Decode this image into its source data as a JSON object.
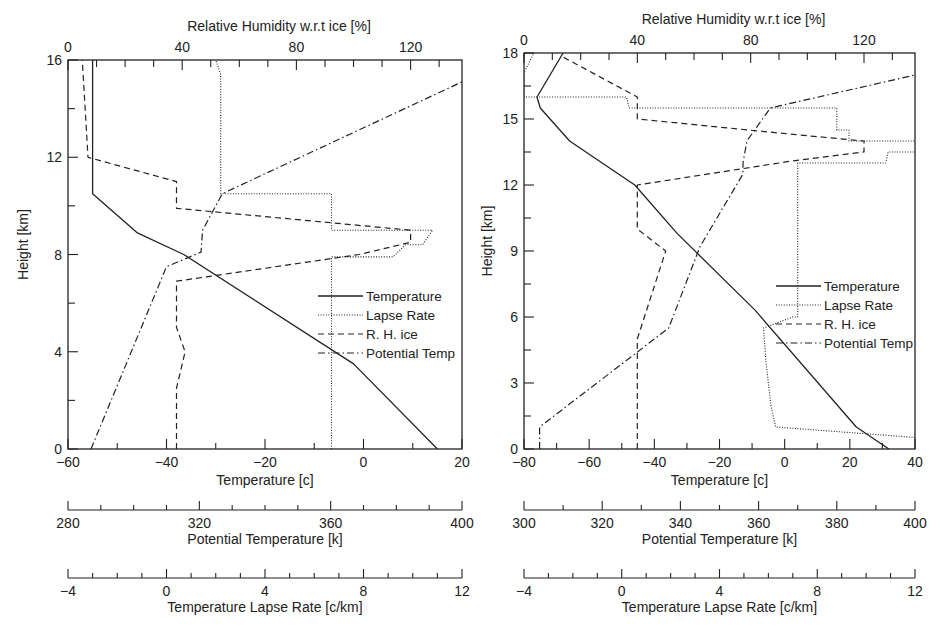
{
  "chart_data": [
    {
      "type": "line",
      "panel": "left",
      "xlabel": "Temperature [c]",
      "ylabel": "Height [km]",
      "top_axis_label": "Relative Humidity w.r.t ice [%]",
      "extra_axes": [
        {
          "label": "Potential Temperature [k]",
          "range": [
            280,
            400
          ],
          "ticks": [
            "280",
            "320",
            "360",
            "400"
          ],
          "minor_step": 10
        },
        {
          "label": "Temperature Lapse Rate [c/km]",
          "range": [
            -4,
            12
          ],
          "ticks": [
            "−4",
            "0",
            "4",
            "8",
            "12"
          ],
          "minor_step": 1
        }
      ],
      "xlim": [
        -60,
        20
      ],
      "ylim": [
        0,
        16
      ],
      "top_xlim": [
        0,
        138
      ],
      "x_ticks": [
        "−60",
        "−40",
        "−20",
        "0",
        "20"
      ],
      "y_ticks": [
        "0",
        "4",
        "8",
        "12",
        "16"
      ],
      "top_ticks": [
        "0",
        "40",
        "80",
        "120"
      ],
      "legend": [
        "Temperature",
        "Lapse Rate",
        "R. H. ice",
        "Potential Temp"
      ],
      "series": [
        {
          "name": "Temperature",
          "axis": "temperature",
          "style": "solid",
          "points": [
            [
              15,
              0
            ],
            [
              -2,
              3.5
            ],
            [
              -36.5,
              8
            ],
            [
              -46,
              8.9
            ],
            [
              -55,
              10.5
            ],
            [
              -55,
              16
            ]
          ]
        },
        {
          "name": "Lapse Rate",
          "axis": "lapse_rate",
          "style": "dotted",
          "points": [
            [
              6.7,
              0
            ],
            [
              6.7,
              7.9
            ],
            [
              9.2,
              7.9
            ],
            [
              9.7,
              8.4
            ],
            [
              10.4,
              8.4
            ],
            [
              10.8,
              9.0
            ],
            [
              6.7,
              9.0
            ],
            [
              6.7,
              10.5
            ],
            [
              2.2,
              10.5
            ],
            [
              2.2,
              15.4
            ],
            [
              2.0,
              16
            ]
          ]
        },
        {
          "name": "R. H. ice",
          "axis": "relative_humidity",
          "style": "dashed",
          "points": [
            [
              38,
              0
            ],
            [
              38,
              2.5
            ],
            [
              41,
              4.0
            ],
            [
              38,
              5.0
            ],
            [
              38,
              6.9
            ],
            [
              102,
              8.0
            ],
            [
              120,
              8.5
            ],
            [
              120,
              9.0
            ],
            [
              38,
              9.9
            ],
            [
              38,
              11.0
            ],
            [
              7,
              12.0
            ],
            [
              5,
              16
            ]
          ]
        },
        {
          "name": "Potential Temp",
          "axis": "potential_temperature",
          "style": "dashdot",
          "points": [
            [
              287,
              0
            ],
            [
              310,
              7.5
            ],
            [
              320.5,
              8.1
            ],
            [
              321,
              9.0
            ],
            [
              327,
              10.5
            ],
            [
              400,
              15.1
            ]
          ]
        }
      ]
    },
    {
      "type": "line",
      "panel": "right",
      "xlabel": "Temperature [c]",
      "ylabel": "Height [km]",
      "top_axis_label": "Relative Humidity w.r.t ice [%]",
      "extra_axes": [
        {
          "label": "Potential Temperature [k]",
          "range": [
            300,
            400
          ],
          "ticks": [
            "300",
            "320",
            "340",
            "360",
            "380",
            "400"
          ],
          "minor_step": 10
        },
        {
          "label": "Temperature Lapse Rate [c/km]",
          "range": [
            -4,
            12
          ],
          "ticks": [
            "−4",
            "0",
            "4",
            "8",
            "12"
          ],
          "minor_step": 1
        }
      ],
      "xlim": [
        -80,
        40
      ],
      "ylim": [
        0,
        18
      ],
      "top_xlim": [
        0,
        138
      ],
      "x_ticks": [
        "−80",
        "−60",
        "−40",
        "−20",
        "0",
        "20",
        "40"
      ],
      "y_ticks": [
        "0",
        "3",
        "6",
        "9",
        "12",
        "15",
        "18"
      ],
      "top_ticks": [
        "0",
        "40",
        "80",
        "120"
      ],
      "legend": [
        "Temperature",
        "Lapse Rate",
        "R. H. ice",
        "Potential Temp"
      ],
      "series": [
        {
          "name": "Temperature",
          "axis": "temperature",
          "style": "solid",
          "points": [
            [
              32,
              0
            ],
            [
              22,
              1
            ],
            [
              -9,
              6.3
            ],
            [
              -33,
              9.8
            ],
            [
              -46,
              12
            ],
            [
              -56,
              13
            ],
            [
              -66,
              14
            ],
            [
              -75,
              15.5
            ],
            [
              -76,
              16
            ],
            [
              -68,
              18
            ]
          ]
        },
        {
          "name": "Lapse Rate",
          "axis": "lapse_rate",
          "style": "dotted",
          "points": [
            [
              12.3,
              0
            ],
            [
              12.3,
              0.5
            ],
            [
              6.3,
              1.0
            ],
            [
              6.1,
              2.0
            ],
            [
              6.0,
              3.0
            ],
            [
              5.9,
              4.0
            ],
            [
              5.8,
              5.5
            ],
            [
              7.0,
              6.0
            ],
            [
              7.2,
              6.0
            ],
            [
              7.2,
              13.0
            ],
            [
              10.8,
              13.0
            ],
            [
              10.9,
              13.5
            ],
            [
              12.3,
              13.5
            ],
            [
              12.3,
              14.0
            ],
            [
              9.3,
              14.0
            ],
            [
              9.3,
              14.5
            ],
            [
              8.8,
              14.5
            ],
            [
              8.8,
              15.5
            ],
            [
              0.3,
              15.5
            ],
            [
              0.2,
              16
            ],
            [
              -4,
              16
            ],
            [
              -4,
              17.1
            ],
            [
              -3.6,
              18
            ]
          ]
        },
        {
          "name": "R. H. ice",
          "axis": "relative_humidity",
          "style": "dashed",
          "points": [
            [
              40,
              0
            ],
            [
              40,
              5
            ],
            [
              50,
              9.0
            ],
            [
              40,
              10
            ],
            [
              40,
              12
            ],
            [
              95,
              13.1
            ],
            [
              120,
              13.5
            ],
            [
              120,
              14.0
            ],
            [
              95,
              14.3
            ],
            [
              40,
              15
            ],
            [
              40,
              16
            ],
            [
              14,
              17.8
            ]
          ]
        },
        {
          "name": "Potential Temp",
          "axis": "potential_temperature",
          "style": "dashdot",
          "points": [
            [
              304,
              0
            ],
            [
              304,
              1
            ],
            [
              337,
              5.5
            ],
            [
              345,
              9.2
            ],
            [
              356,
              12.5
            ],
            [
              356,
              13
            ],
            [
              357,
              14.0
            ],
            [
              363,
              15.5
            ],
            [
              400,
              17.0
            ]
          ]
        }
      ]
    }
  ],
  "panels": {
    "left": {
      "top_title": "Relative Humidity w.r.t ice [%]",
      "ylabel": "Height [km]",
      "xlabel": "Temperature [c]",
      "pt_label": "Potential Temperature [k]",
      "lr_label": "Temperature Lapse Rate [c/km]",
      "legend": {
        "t": "Temperature",
        "lr": "Lapse Rate",
        "rh": "R. H. ice",
        "pt": "Potential Temp"
      }
    },
    "right": {
      "top_title": "Relative Humidity w.r.t ice [%]",
      "ylabel": "Height [km]",
      "xlabel": "Temperature [c]",
      "pt_label": "Potential Temperature [k]",
      "lr_label": "Temperature Lapse Rate [c/km]",
      "legend": {
        "t": "Temperature",
        "lr": "Lapse Rate",
        "rh": "R. H. ice",
        "pt": "Potential Temp"
      }
    }
  },
  "colors": {
    "ink": "#222222",
    "background": "#ffffff"
  }
}
